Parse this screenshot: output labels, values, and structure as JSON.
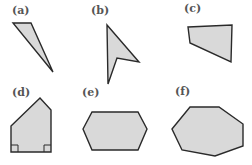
{
  "figure": {
    "fill_color": "#d9d9d9",
    "stroke_color": "#2a2a2a",
    "panels": [
      {
        "label": "(a)",
        "shape": "triangle",
        "points": "13,23 31,23 53,72",
        "label_pos": [
          12,
          14
        ]
      },
      {
        "label": "(b)",
        "shape": "concave quadrilateral",
        "points": "107,25 139,62 117,58 108,84",
        "label_pos": [
          91,
          14
        ]
      },
      {
        "label": "(c)",
        "shape": "quadrilateral",
        "points": "188,27 232,25 231,62 190,43",
        "label_pos": [
          184,
          12
        ]
      },
      {
        "label": "(d)",
        "shape": "pentagon with two right angles",
        "points": "11,126 40,98 51,110 51,152 11,152",
        "label_pos": [
          12,
          96
        ]
      },
      {
        "label": "(e)",
        "shape": "hexagon",
        "points": "83,129 92,112 138,112 147,129 138,150 92,150",
        "label_pos": [
          82,
          96
        ]
      },
      {
        "label": "(f)",
        "shape": "heptagon",
        "points": "172,129 190,107 219,107 243,124 243,146 215,156 182,150",
        "label_pos": [
          175,
          95
        ]
      }
    ]
  }
}
